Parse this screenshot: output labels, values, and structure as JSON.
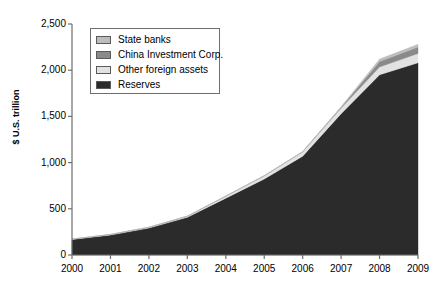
{
  "chart_data": {
    "type": "area",
    "title": "",
    "subtitle": "",
    "xlabel": "",
    "ylabel": "$ U.S. trillion",
    "x": [
      2000,
      2001,
      2002,
      2003,
      2004,
      2005,
      2006,
      2007,
      2008,
      2009
    ],
    "xtick_labels": [
      "2000",
      "2001",
      "2002",
      "2003",
      "2004",
      "2005",
      "2006",
      "2007",
      "2008",
      "2009"
    ],
    "ytick_labels": [
      "0",
      "500",
      "1,000",
      "1,500",
      "2,000",
      "2,500"
    ],
    "ytick_values": [
      0,
      500,
      1000,
      1500,
      2000,
      2500
    ],
    "xlim": [
      2000,
      2009
    ],
    "ylim": [
      0,
      2500
    ],
    "grid": false,
    "stacked": true,
    "legend_position": "upper-left-inside",
    "series": [
      {
        "name": "Reserves",
        "color": "#2b2b2b",
        "values": [
          168,
          216,
          292,
          408,
          615,
          822,
          1070,
          1530,
          1950,
          2080
        ]
      },
      {
        "name": "Other foreign assets",
        "color": "#e2e2e2",
        "values": [
          4,
          6,
          8,
          12,
          22,
          35,
          48,
          60,
          85,
          100
        ]
      },
      {
        "name": "China Investment Corp.",
        "color": "#8a8a8a",
        "values": [
          0,
          0,
          0,
          0,
          0,
          0,
          0,
          10,
          60,
          70
        ]
      },
      {
        "name": "State banks",
        "color": "#bdbdbd",
        "values": [
          0,
          0,
          0,
          0,
          0,
          0,
          0,
          5,
          25,
          30
        ]
      }
    ],
    "legend_entries": [
      {
        "label": "State banks",
        "color": "#bdbdbd"
      },
      {
        "label": "China Investment Corp.",
        "color": "#8a8a8a"
      },
      {
        "label": "Other foreign assets",
        "color": "#e2e2e2"
      },
      {
        "label": "Reserves",
        "color": "#2b2b2b"
      }
    ],
    "axis_color": "#6e6e6e"
  }
}
